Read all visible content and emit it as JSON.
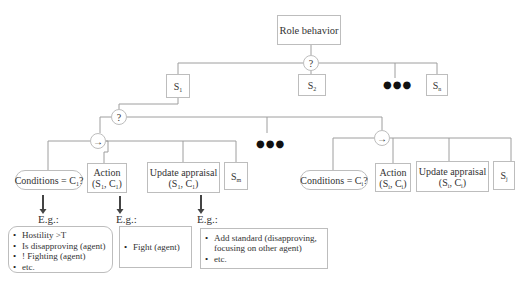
{
  "root": {
    "label": "Role behavior"
  },
  "selector_symbol": "?",
  "sequence_symbol": "→",
  "ellipsis": "●●●",
  "states": {
    "s1": {
      "base": "S",
      "sub": "1"
    },
    "s2": {
      "base": "S",
      "sub": "2"
    },
    "sn": {
      "base": "S",
      "sub": "n"
    }
  },
  "left_sequence": {
    "condition": {
      "text": "Conditions = C",
      "sub": "1",
      "suffix": "?"
    },
    "action": {
      "title": "Action",
      "args_open": "(S",
      "arg1_sub": "1",
      "args_mid": ", C",
      "arg2_sub": "1",
      "args_close": ")"
    },
    "update": {
      "title": "Update appraisal",
      "args_open": "(S",
      "arg1_sub": "1",
      "args_mid": ", C",
      "arg2_sub": "1",
      "args_close": ")"
    },
    "next_state": {
      "base": "S",
      "sub": "m"
    }
  },
  "right_sequence": {
    "condition": {
      "text": "Conditions = C",
      "sub": "i",
      "suffix": "?"
    },
    "action": {
      "title": "Action",
      "args_open": "(S",
      "arg1_sub": "i",
      "args_mid": ", C",
      "arg2_sub": "i",
      "args_close": ")"
    },
    "update": {
      "title": "Update appraisal",
      "args_open": "(S",
      "arg1_sub": "i",
      "args_mid": ", C",
      "arg2_sub": "i",
      "args_close": ")"
    },
    "next_state": {
      "base": "S",
      "sub": "j"
    }
  },
  "examples": {
    "label": "E.g.:",
    "conditions": [
      "Hostility >T",
      "Is disapproving (agent)",
      "! Fighting (agent)",
      "etc."
    ],
    "action": [
      "Fight (agent)"
    ],
    "update": [
      "Add standard (disapproving, focusing on other agent)",
      "etc."
    ]
  },
  "colors": {
    "line": "#9e9e9e",
    "border": "#bdbdbd",
    "arrow": "#444444",
    "text": "#333333"
  }
}
